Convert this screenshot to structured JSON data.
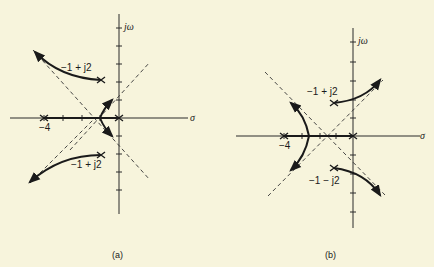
{
  "figure": {
    "panel_a": {
      "caption": "(a)",
      "axis_labels": {
        "vertical": "jω",
        "horizontal": "σ"
      },
      "tick_label_neg4": "−4",
      "pole_labels": {
        "upper": "−1 + j2",
        "lower": "−1 + j2"
      },
      "poles": [
        "0",
        "−4",
        "−1 + j2",
        "−1 − j2"
      ]
    },
    "panel_b": {
      "caption": "(b)",
      "axis_labels": {
        "vertical": "jω",
        "horizontal": "σ"
      },
      "tick_label_neg4": "−4",
      "pole_labels": {
        "upper": "−1 + j2",
        "lower": "−1 − j2"
      },
      "poles": [
        "0",
        "−4",
        "−1 + j2",
        "−1 − j2"
      ]
    }
  }
}
